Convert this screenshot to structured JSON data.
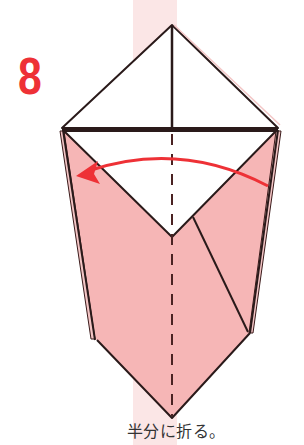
{
  "step": {
    "number": "8",
    "instruction": "半分に折る。"
  },
  "colors": {
    "step_number": "#ee3136",
    "paper_colored_side": "#f6b6b6",
    "paper_white_side": "#ffffff",
    "background_stripe": "#fbe6e6",
    "outline": "#3a1a1a",
    "arrow": "#ee3136"
  },
  "diagram": {
    "fold_type": "valley fold in half",
    "arrow_direction": "right-to-left"
  }
}
